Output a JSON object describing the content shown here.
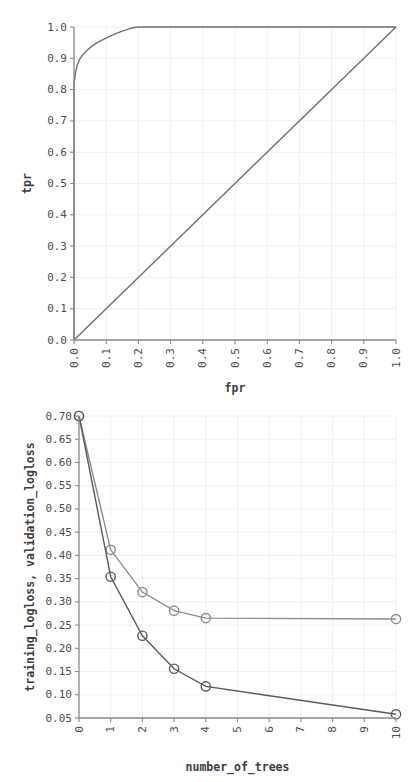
{
  "page": {
    "background": "#ffffff",
    "foreground": "#4d4d4d"
  },
  "chart_data": [
    {
      "id": "roc-curve",
      "type": "line",
      "title": "",
      "xlabel": "fpr",
      "ylabel": "tpr",
      "xlim": [
        0.0,
        1.0
      ],
      "ylim": [
        0.0,
        1.0
      ],
      "grid": true,
      "legend": "none",
      "xticks": [
        "0.0",
        "0.1",
        "0.2",
        "0.3",
        "0.4",
        "0.5",
        "0.6",
        "0.7",
        "0.8",
        "0.9",
        "1.0"
      ],
      "yticks": [
        "0.0",
        "0.1",
        "0.2",
        "0.3",
        "0.4",
        "0.5",
        "0.6",
        "0.7",
        "0.8",
        "0.9",
        "1.0"
      ],
      "xtick_rotation": 90,
      "series": [
        {
          "name": "roc",
          "color": "#707070",
          "x": [
            0.0,
            0.0,
            0.005,
            0.01,
            0.018,
            0.028,
            0.04,
            0.055,
            0.072,
            0.09,
            0.11,
            0.13,
            0.15,
            0.17,
            0.19,
            0.205,
            0.3,
            0.4,
            0.5,
            0.6,
            0.7,
            0.8,
            0.9,
            1.0
          ],
          "y": [
            0.0,
            0.82,
            0.855,
            0.878,
            0.898,
            0.912,
            0.925,
            0.938,
            0.95,
            0.96,
            0.97,
            0.979,
            0.987,
            0.994,
            0.999,
            1.0,
            1.0,
            1.0,
            1.0,
            1.0,
            1.0,
            1.0,
            1.0,
            1.0
          ]
        },
        {
          "name": "diagonal",
          "color": "#707070",
          "x": [
            0.0,
            1.0
          ],
          "y": [
            0.0,
            1.0
          ]
        }
      ]
    },
    {
      "id": "logloss-curve",
      "type": "line",
      "title": "",
      "xlabel": "number_of_trees",
      "ylabel": "training_logloss, validation_logloss",
      "xlim": [
        0,
        10
      ],
      "ylim": [
        0.05,
        0.7
      ],
      "grid": true,
      "legend": "none",
      "xticks": [
        "0",
        "1",
        "2",
        "3",
        "4",
        "5",
        "6",
        "7",
        "8",
        "9",
        "10"
      ],
      "yticks": [
        "0.05",
        "0.10",
        "0.15",
        "0.20",
        "0.25",
        "0.30",
        "0.35",
        "0.40",
        "0.45",
        "0.50",
        "0.55",
        "0.60",
        "0.65",
        "0.70"
      ],
      "xtick_rotation": 90,
      "series": [
        {
          "name": "validation_logloss",
          "color": "#8c8c8c",
          "marker": "circle-open",
          "x": [
            0,
            1,
            2,
            3,
            4,
            10
          ],
          "y": [
            0.7,
            0.412,
            0.321,
            0.281,
            0.265,
            0.263
          ]
        },
        {
          "name": "training_logloss",
          "color": "#5a5a5a",
          "marker": "circle-open",
          "x": [
            0,
            1,
            2,
            3,
            4,
            10
          ],
          "y": [
            0.7,
            0.354,
            0.227,
            0.156,
            0.118,
            0.058
          ]
        }
      ]
    }
  ]
}
